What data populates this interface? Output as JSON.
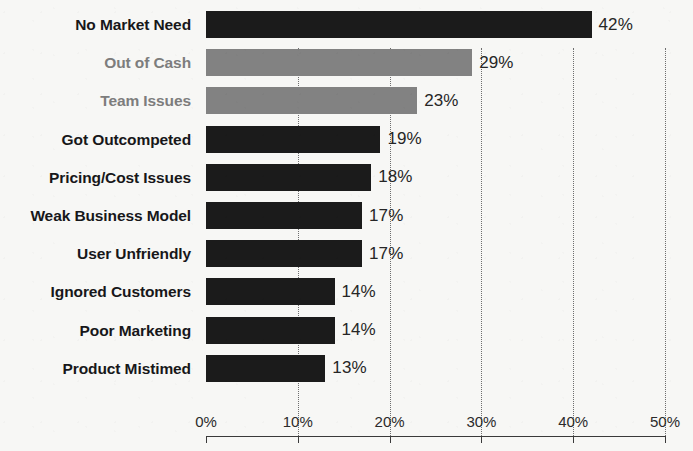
{
  "chart_data": {
    "type": "bar",
    "orientation": "horizontal",
    "title": "",
    "subtitle": "",
    "xlabel": "",
    "ylabel": "",
    "xlim": [
      0,
      50
    ],
    "xunit": "%",
    "xticks": [
      0,
      10,
      20,
      30,
      40,
      50
    ],
    "xticklabels": [
      "0%",
      "10%",
      "20%",
      "30%",
      "40%",
      "50%"
    ],
    "grid": "vertical-dotted",
    "legend": "none",
    "categories": [
      "No Market Need",
      "Out of Cash",
      "Team Issues",
      "Got Outcompeted",
      "Pricing/Cost Issues",
      "Weak Business Model",
      "User Unfriendly",
      "Ignored Customers",
      "Poor Marketing",
      "Product Mistimed"
    ],
    "values": [
      42,
      29,
      23,
      19,
      18,
      17,
      17,
      14,
      14,
      13
    ],
    "datalabels": [
      "42%",
      "29%",
      "23%",
      "19%",
      "18%",
      "17%",
      "17%",
      "14%",
      "14%",
      "13%"
    ],
    "bar_colors": [
      "#1b1b1b",
      "#828282",
      "#828282",
      "#1b1b1b",
      "#1b1b1b",
      "#1b1b1b",
      "#1b1b1b",
      "#1b1b1b",
      "#1b1b1b",
      "#1b1b1b"
    ],
    "label_colors": [
      "#17171a",
      "#7d7d7d",
      "#7d7d7d",
      "#17171a",
      "#17171a",
      "#17171a",
      "#17171a",
      "#17171a",
      "#17171a",
      "#17171a"
    ]
  },
  "colors": {
    "background": "#f7f7f5",
    "bar_dark": "#1b1b1b",
    "bar_gray": "#828282",
    "axis": "#3a3a3a",
    "gridline": "#6e6e6e",
    "text": "#17171a",
    "text_muted": "#7d7d7d"
  }
}
